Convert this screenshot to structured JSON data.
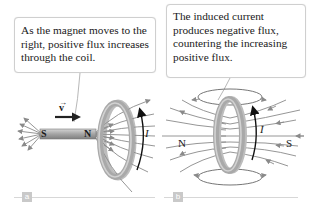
{
  "figure": {
    "topic": "Lenz's law: magnet moving toward a conducting loop",
    "panels": [
      {
        "id": "a",
        "label": "a",
        "callout": "As the magnet moves to the right, positive flux increases through the coil.",
        "velocity_label": "v",
        "magnet": {
          "left_pole": "S",
          "right_pole": "N"
        },
        "current_label": "I"
      },
      {
        "id": "b",
        "label": "b",
        "callout": "The induced current produces negative flux, countering the increasing positive flux.",
        "poles": {
          "left": "N",
          "right": "S"
        },
        "current_label": "I"
      }
    ],
    "colors": {
      "coil": "#a9a9a9",
      "coil_highlight": "#d6d6d6",
      "field_lines": "#8a8a8a",
      "magnet": "#9b9b9b",
      "arrow_current": "#111111",
      "label_box": "#c9c9c9"
    }
  }
}
